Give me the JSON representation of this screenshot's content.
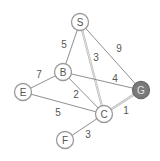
{
  "graph": {
    "nodes": [
      {
        "id": "S",
        "label": "S",
        "x": 80,
        "y": 22,
        "goal": false
      },
      {
        "id": "B",
        "label": "B",
        "x": 63,
        "y": 72,
        "goal": false
      },
      {
        "id": "E",
        "label": "E",
        "x": 23,
        "y": 92,
        "goal": false
      },
      {
        "id": "C",
        "label": "C",
        "x": 104,
        "y": 114,
        "goal": false
      },
      {
        "id": "F",
        "label": "F",
        "x": 65,
        "y": 140,
        "goal": false
      },
      {
        "id": "G",
        "label": "G",
        "x": 141,
        "y": 90,
        "goal": true
      }
    ],
    "edges": [
      {
        "from": "S",
        "to": "B",
        "weight": "5",
        "lx": 64,
        "ly": 44,
        "highlight": false
      },
      {
        "from": "S",
        "to": "C",
        "weight": "3",
        "lx": 96,
        "ly": 57,
        "highlight": true
      },
      {
        "from": "S",
        "to": "G",
        "weight": "9",
        "lx": 119,
        "ly": 48,
        "highlight": false
      },
      {
        "from": "B",
        "to": "G",
        "weight": "4",
        "lx": 115,
        "ly": 78,
        "highlight": false
      },
      {
        "from": "B",
        "to": "E",
        "weight": "7",
        "lx": 39,
        "ly": 74,
        "highlight": false
      },
      {
        "from": "B",
        "to": "C",
        "weight": "2",
        "lx": 76,
        "ly": 94,
        "highlight": false
      },
      {
        "from": "E",
        "to": "C",
        "weight": "5",
        "lx": 58,
        "ly": 112,
        "highlight": false
      },
      {
        "from": "C",
        "to": "G",
        "weight": "1",
        "lx": 126,
        "ly": 110,
        "highlight": true
      },
      {
        "from": "C",
        "to": "F",
        "weight": "3",
        "lx": 88,
        "ly": 134,
        "highlight": false
      }
    ],
    "colors": {
      "edge": "#8f8f8f",
      "highlight_edge": "#b8b8b8",
      "node_stroke": "#9a9a9a",
      "goal_fill": "#7a7a7a",
      "label": "#555555"
    }
  }
}
